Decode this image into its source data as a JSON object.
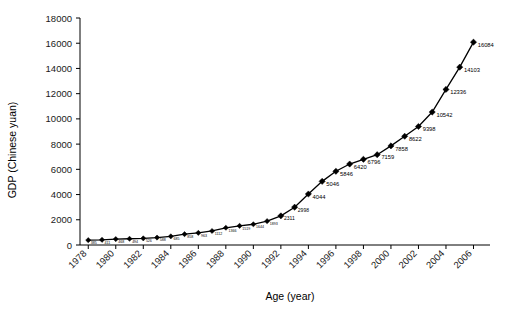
{
  "chart_data": {
    "type": "line",
    "title": "",
    "xlabel": "Age (year)",
    "ylabel": "GDP (Chinese yuan)",
    "xlim": [
      1977.4,
      2007.2
    ],
    "ylim": [
      0,
      18000
    ],
    "ytick_step": 2000,
    "xtick_step": 2,
    "grid": false,
    "legend": null,
    "marker": "diamond",
    "line_color": "#000000",
    "marker_color": "#000000",
    "yticks": [
      "0",
      "2000",
      "4000",
      "6000",
      "8000",
      "10000",
      "12000",
      "14000",
      "16000",
      "18000"
    ],
    "xticks": [
      "1978",
      "1980",
      "1982",
      "1984",
      "1986",
      "1988",
      "1990",
      "1992",
      "1994",
      "1996",
      "1998",
      "2000",
      "2002",
      "2004",
      "2006"
    ],
    "x": [
      1978,
      1979,
      1980,
      1981,
      1982,
      1983,
      1984,
      1985,
      1986,
      1987,
      1988,
      1989,
      1990,
      1991,
      1992,
      1993,
      1994,
      1995,
      1996,
      1997,
      1998,
      1999,
      2000,
      2001,
      2002,
      2003,
      2004,
      2005,
      2006
    ],
    "values": [
      385,
      411,
      468,
      494,
      526,
      588,
      685,
      858,
      963,
      1112,
      1366,
      1519,
      1644,
      1893,
      2311,
      2998,
      4044,
      5046,
      5846,
      6420,
      6796,
      7159,
      7858,
      8622,
      9398,
      10542,
      12336,
      14103,
      16084
    ],
    "point_labels": [
      "385",
      "411",
      "468",
      "494",
      "526",
      "588",
      "685",
      "858",
      "963",
      "1112",
      "1366",
      "1519",
      "1644",
      "1893",
      "2311",
      "2998",
      "4044",
      "5046",
      "5846",
      "6420",
      "6796",
      "7159",
      "7858",
      "8622",
      "9398",
      "10542",
      "12336",
      "14103",
      "16084"
    ]
  },
  "axes": {
    "x_title": "Age (year)",
    "y_title": "GDP (Chinese yuan)"
  }
}
